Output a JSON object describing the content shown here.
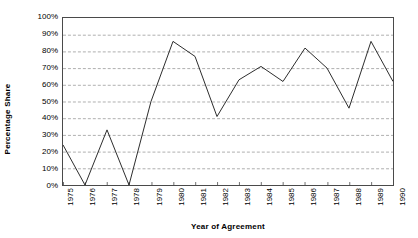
{
  "chart_data": {
    "type": "line",
    "title": "",
    "xlabel": "Year of Agreement",
    "ylabel": "Percentage Share",
    "categories": [
      "1975",
      "1976",
      "1977",
      "1978",
      "1979",
      "1980",
      "1981",
      "1982",
      "1983",
      "1984",
      "1985",
      "1986",
      "1987",
      "1988",
      "1989",
      "1990"
    ],
    "values": [
      24,
      0,
      33,
      0,
      50,
      86,
      77,
      41,
      63,
      71,
      62,
      82,
      70,
      46,
      86,
      62
    ],
    "series": [
      {
        "name": "Percentage Share",
        "values": [
          24,
          0,
          33,
          0,
          50,
          86,
          77,
          41,
          63,
          71,
          62,
          82,
          70,
          46,
          86,
          62
        ]
      }
    ],
    "ylim": [
      0,
      100
    ],
    "ytick_labels": [
      "0%",
      "10%",
      "20%",
      "30%",
      "40%",
      "50%",
      "60%",
      "70%",
      "80%",
      "90%",
      "100%"
    ],
    "ytick_values": [
      0,
      10,
      20,
      30,
      40,
      50,
      60,
      70,
      80,
      90,
      100
    ],
    "grid": "horizontal-dashed",
    "legend": "none",
    "line_color": "#2b2b2b",
    "grid_color": "#9a9a9a",
    "axis_color": "#4a4a4a",
    "background_color": "#ffffff"
  }
}
